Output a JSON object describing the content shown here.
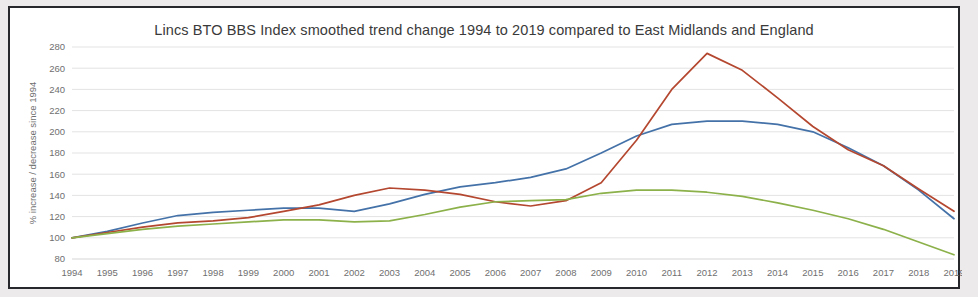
{
  "frame": {
    "border_color": "#26282b",
    "background": "#ffffff"
  },
  "chart_data": {
    "type": "line",
    "title": "Lincs BTO BBS Index smoothed trend change 1994 to 2019 compared to East Midlands and England",
    "xlabel": "",
    "ylabel": "% increase / decrease since 1994",
    "x": [
      1994,
      1995,
      1996,
      1997,
      1998,
      1999,
      2000,
      2001,
      2002,
      2003,
      2004,
      2005,
      2006,
      2007,
      2008,
      2009,
      2010,
      2011,
      2012,
      2013,
      2014,
      2015,
      2016,
      2017,
      2018,
      2019
    ],
    "categories": [
      "1994",
      "1995",
      "1996",
      "1997",
      "1998",
      "1999",
      "2000",
      "2001",
      "2002",
      "2003",
      "2004",
      "2005",
      "2006",
      "2007",
      "2008",
      "2009",
      "2010",
      "2011",
      "2012",
      "2013",
      "2014",
      "2015",
      "2016",
      "2017",
      "2018",
      "2019"
    ],
    "ylim": [
      80,
      280
    ],
    "yticks": [
      80,
      100,
      120,
      140,
      160,
      180,
      200,
      220,
      240,
      260,
      280
    ],
    "grid": true,
    "legend_position": "bottom",
    "series": [
      {
        "name": "Lincolnshire",
        "color": "#4472a8",
        "values": [
          100,
          106,
          114,
          121,
          124,
          126,
          128,
          128,
          125,
          132,
          141,
          148,
          152,
          157,
          165,
          180,
          196,
          207,
          210,
          210,
          207,
          200,
          185,
          168,
          145,
          118
        ]
      },
      {
        "name": "East Midlands",
        "color": "#b4472f",
        "values": [
          100,
          105,
          110,
          114,
          116,
          119,
          125,
          131,
          140,
          147,
          145,
          141,
          134,
          130,
          135,
          152,
          192,
          240,
          274,
          258,
          232,
          205,
          183,
          168,
          146,
          125
        ]
      },
      {
        "name": "England",
        "color": "#8cb14a",
        "values": [
          100,
          104,
          108,
          111,
          113,
          115,
          117,
          117,
          115,
          116,
          122,
          129,
          134,
          135,
          136,
          142,
          145,
          145,
          143,
          139,
          133,
          126,
          118,
          108,
          96,
          84
        ]
      }
    ]
  }
}
